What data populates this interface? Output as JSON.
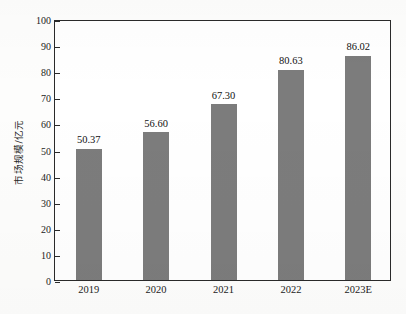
{
  "chart_data": {
    "type": "bar",
    "title": "",
    "subtitle": "",
    "xlabel": "",
    "ylabel": "市场规模/亿元",
    "categories": [
      "2019",
      "2020",
      "2021",
      "2022",
      "2023E"
    ],
    "values": [
      50.37,
      56.6,
      67.3,
      80.63,
      86.02
    ],
    "value_labels": [
      "50.37",
      "56.60",
      "67.30",
      "80.63",
      "86.02"
    ],
    "series": [
      {
        "name": "市场规模",
        "values": [
          50.37,
          56.6,
          67.3,
          80.63,
          86.02
        ]
      }
    ],
    "ylim": [
      0,
      100
    ],
    "ytick_step": 10,
    "ytick_labels": [
      "0",
      "10",
      "20",
      "30",
      "40",
      "50",
      "60",
      "70",
      "80",
      "90",
      "100"
    ],
    "ytick_values": [
      0,
      10,
      20,
      30,
      40,
      50,
      60,
      70,
      80,
      90,
      100
    ],
    "grid": false,
    "legend": null,
    "legend_position": "none",
    "bar_color": "#7c7c7c",
    "axis_color": "#2a2a2a",
    "text_color": "#1b1b1b",
    "background_color": "#ffffff",
    "tick_direction": "in",
    "frame": "full-box",
    "data_labels_shown": true,
    "annotations": []
  }
}
